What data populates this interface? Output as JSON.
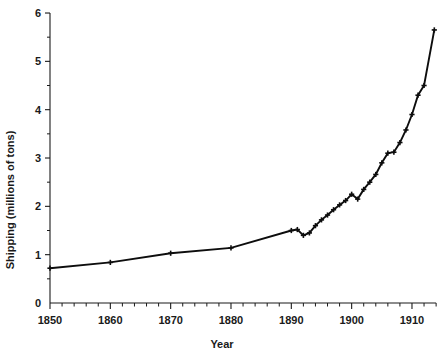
{
  "chart_data": {
    "type": "line",
    "title": "",
    "xlabel": "Year",
    "ylabel": "Shipping (millions of tons)",
    "xlim": [
      1850,
      1914
    ],
    "ylim": [
      0,
      6
    ],
    "grid": false,
    "legend": null,
    "x_ticks": [
      1850,
      1860,
      1870,
      1880,
      1890,
      1900,
      1910
    ],
    "x_tick_labels": [
      "1850",
      "1860",
      "1870",
      "1880",
      "1890",
      "1900",
      "1910"
    ],
    "x_minor_tick_step": 2,
    "y_ticks": [
      0,
      1,
      2,
      3,
      4,
      5,
      6
    ],
    "y_tick_labels": [
      "0",
      "1",
      "2",
      "3",
      "4",
      "5",
      "6"
    ],
    "y_minor_ticks": [
      0.5,
      1.5,
      2.5,
      3.5,
      4.5,
      5.5
    ],
    "marker": "plus",
    "series": [
      {
        "name": "Shipping",
        "color": "#0d0d0d",
        "x": [
          1850,
          1860,
          1870,
          1880,
          1890,
          1891,
          1892,
          1893,
          1894,
          1895,
          1896,
          1897,
          1898,
          1899,
          1900,
          1901,
          1902,
          1903,
          1904,
          1905,
          1906,
          1907,
          1908,
          1909,
          1910,
          1911,
          1912,
          1913.7
        ],
        "y": [
          0.72,
          0.84,
          1.03,
          1.14,
          1.5,
          1.52,
          1.4,
          1.45,
          1.6,
          1.72,
          1.82,
          1.93,
          2.03,
          2.12,
          2.25,
          2.15,
          2.35,
          2.5,
          2.66,
          2.9,
          3.1,
          3.12,
          3.32,
          3.58,
          3.9,
          4.3,
          4.5,
          5.65
        ]
      }
    ]
  },
  "axes": {
    "x_title": "Year",
    "y_title": "Shipping (millions of tons)"
  }
}
